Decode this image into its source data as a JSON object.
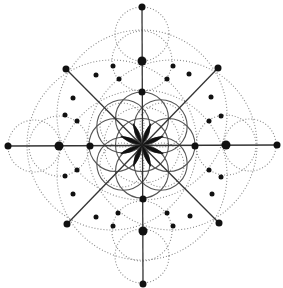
{
  "diagram": {
    "title": "",
    "style": "sacred geometry mandala",
    "center": [
      142,
      145
    ],
    "colors": {
      "ink": "#111111",
      "solid_line": "#555555",
      "dotted_line": "#8a8a8a",
      "background": "#ffffff"
    },
    "axes": [
      {
        "name": "vertical",
        "from": [
          142,
          7
        ],
        "to": [
          143,
          284
        ]
      },
      {
        "name": "horizontal",
        "from": [
          8,
          146
        ],
        "to": [
          277,
          145
        ]
      },
      {
        "name": "diag-tl-br",
        "from": [
          66,
          69
        ],
        "to": [
          218,
          222
        ]
      },
      {
        "name": "diag-tr-bl",
        "from": [
          218,
          68
        ],
        "to": [
          67,
          224
        ]
      }
    ],
    "solid_circles": [
      {
        "cx": 142,
        "cy": 145,
        "r": 26.5
      },
      {
        "cx": 142,
        "cy": 118.5,
        "r": 26.5
      },
      {
        "cx": 142,
        "cy": 171.5,
        "r": 26.5
      },
      {
        "cx": 115.5,
        "cy": 145,
        "r": 26.5
      },
      {
        "cx": 168.5,
        "cy": 145,
        "r": 26.5
      },
      {
        "cx": 123.3,
        "cy": 126.3,
        "r": 26.5
      },
      {
        "cx": 160.7,
        "cy": 126.3,
        "r": 26.5
      },
      {
        "cx": 123.3,
        "cy": 163.7,
        "r": 26.5
      },
      {
        "cx": 160.7,
        "cy": 163.7,
        "r": 26.5
      }
    ],
    "dotted_circles": [
      {
        "cx": 142,
        "cy": 34,
        "r": 27
      },
      {
        "cx": 142,
        "cy": 256,
        "r": 27
      },
      {
        "cx": 34,
        "cy": 146,
        "r": 26
      },
      {
        "cx": 250,
        "cy": 145,
        "r": 26
      },
      {
        "cx": 142,
        "cy": 61,
        "r": 30
      },
      {
        "cx": 142,
        "cy": 231,
        "r": 30
      },
      {
        "cx": 59,
        "cy": 146,
        "r": 30
      },
      {
        "cx": 226,
        "cy": 145,
        "r": 30
      },
      {
        "cx": 142,
        "cy": 115,
        "r": 85
      },
      {
        "cx": 142,
        "cy": 175,
        "r": 85
      },
      {
        "cx": 112,
        "cy": 145,
        "r": 85
      },
      {
        "cx": 172,
        "cy": 145,
        "r": 85
      },
      {
        "cx": 142,
        "cy": 145,
        "r": 38
      },
      {
        "cx": 122,
        "cy": 125,
        "r": 22
      },
      {
        "cx": 162,
        "cy": 125,
        "r": 22
      },
      {
        "cx": 122,
        "cy": 165,
        "r": 22
      },
      {
        "cx": 162,
        "cy": 165,
        "r": 22
      }
    ],
    "dots": [
      {
        "x": 142,
        "y": 7,
        "r": 3.5
      },
      {
        "x": 142,
        "y": 61,
        "r": 4.5
      },
      {
        "x": 142,
        "y": 92,
        "r": 3.5
      },
      {
        "x": 143,
        "y": 199,
        "r": 3.5
      },
      {
        "x": 143,
        "y": 231,
        "r": 4.5
      },
      {
        "x": 143,
        "y": 284,
        "r": 3.5
      },
      {
        "x": 8,
        "y": 146,
        "r": 3.5
      },
      {
        "x": 59,
        "y": 146,
        "r": 4.5
      },
      {
        "x": 90,
        "y": 146,
        "r": 3.5
      },
      {
        "x": 195,
        "y": 146,
        "r": 3.5
      },
      {
        "x": 226,
        "y": 145,
        "r": 4.5
      },
      {
        "x": 277,
        "y": 145,
        "r": 3.5
      },
      {
        "x": 66,
        "y": 69,
        "r": 3.5
      },
      {
        "x": 218,
        "y": 68,
        "r": 3.5
      },
      {
        "x": 67,
        "y": 224,
        "r": 3.5
      },
      {
        "x": 219,
        "y": 223,
        "r": 3.5
      },
      {
        "x": 113,
        "y": 66,
        "r": 2.5
      },
      {
        "x": 119,
        "y": 79,
        "r": 2.5
      },
      {
        "x": 173,
        "y": 66,
        "r": 2.5
      },
      {
        "x": 167,
        "y": 79,
        "r": 2.5
      },
      {
        "x": 96,
        "y": 75,
        "r": 2.5
      },
      {
        "x": 189,
        "y": 74,
        "r": 2.5
      },
      {
        "x": 73,
        "y": 98,
        "r": 2.5
      },
      {
        "x": 211,
        "y": 97,
        "r": 2.5
      },
      {
        "x": 65,
        "y": 115,
        "r": 2.5
      },
      {
        "x": 77,
        "y": 121,
        "r": 2.5
      },
      {
        "x": 221,
        "y": 116,
        "r": 2.5
      },
      {
        "x": 209,
        "y": 121,
        "r": 2.5
      },
      {
        "x": 65,
        "y": 176,
        "r": 2.5
      },
      {
        "x": 77,
        "y": 170,
        "r": 2.5
      },
      {
        "x": 221,
        "y": 177,
        "r": 2.5
      },
      {
        "x": 209,
        "y": 170,
        "r": 2.5
      },
      {
        "x": 73,
        "y": 194,
        "r": 2.5
      },
      {
        "x": 212,
        "y": 194,
        "r": 2.5
      },
      {
        "x": 96,
        "y": 217,
        "r": 2.5
      },
      {
        "x": 190,
        "y": 216,
        "r": 2.5
      },
      {
        "x": 118,
        "y": 213,
        "r": 2.5
      },
      {
        "x": 167,
        "y": 213,
        "r": 2.5
      },
      {
        "x": 113,
        "y": 226,
        "r": 2.5
      },
      {
        "x": 173,
        "y": 226,
        "r": 2.5
      }
    ],
    "star": {
      "petals": 8,
      "length": 24,
      "width": 4.2
    }
  }
}
